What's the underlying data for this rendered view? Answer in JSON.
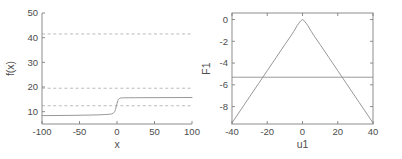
{
  "figure": {
    "panel_count": 2,
    "background_color": "#ffffff",
    "axis_color": "#808080",
    "curve_color": "#8c8c8c",
    "dashed_color": "#b3b3b3"
  },
  "chart_data": [
    {
      "type": "line",
      "panel": "left",
      "title": "",
      "xlabel": "x",
      "ylabel": "f(x)",
      "xlim": [
        -100,
        100
      ],
      "ylim": [
        5,
        50
      ],
      "xticks": [
        -100,
        -50,
        0,
        50,
        100
      ],
      "xtick_labels": [
        "-100",
        "-50",
        "0",
        "50",
        "100"
      ],
      "yticks": [
        10,
        20,
        30,
        40,
        50
      ],
      "ytick_labels": [
        "10",
        "20",
        "30",
        "40",
        "50"
      ],
      "grid": false,
      "box": false,
      "legend": null,
      "series": [
        {
          "name": "f(x) sigmoid step",
          "x": [
            -100,
            -80,
            -60,
            -40,
            -25,
            -15,
            -10,
            -7,
            -5,
            -3,
            -2,
            -1,
            0,
            1,
            2,
            3,
            5,
            7,
            10,
            15,
            25,
            40,
            60,
            80,
            100
          ],
          "y": [
            8.4,
            8.45,
            8.5,
            8.6,
            8.7,
            8.85,
            8.95,
            9.1,
            9.35,
            10.1,
            10.9,
            12.2,
            13.3,
            14.4,
            15.0,
            15.3,
            15.55,
            15.6,
            15.62,
            15.64,
            15.66,
            15.68,
            15.7,
            15.72,
            15.75
          ]
        }
      ],
      "reference_lines": [
        {
          "name": "upper-dashed",
          "orientation": "horizontal",
          "y": 41.5,
          "style": "dashed"
        },
        {
          "name": "middle-dashed",
          "orientation": "horizontal",
          "y": 19.5,
          "style": "dashed"
        },
        {
          "name": "lower-dashed",
          "orientation": "horizontal",
          "y": 12.4,
          "style": "dashed"
        }
      ]
    },
    {
      "type": "line",
      "panel": "right",
      "title": "",
      "xlabel": "u1",
      "ylabel": "F1",
      "xlim": [
        -40,
        40
      ],
      "ylim": [
        -9.6,
        0.6
      ],
      "xticks": [
        -40,
        -20,
        0,
        20,
        40
      ],
      "xtick_labels": [
        "-40",
        "-20",
        "0",
        "20",
        "40"
      ],
      "yticks": [
        0,
        -2,
        -4,
        -6,
        -8
      ],
      "ytick_labels": [
        "0",
        "-2",
        "-4",
        "-6",
        "-8"
      ],
      "grid": false,
      "box": true,
      "legend": null,
      "series": [
        {
          "name": "F1(u1)",
          "x": [
            -40,
            -35,
            -30,
            -25,
            -20,
            -15,
            -10,
            -7,
            -5,
            -3,
            -2,
            -1,
            0,
            1,
            2,
            3,
            5,
            7,
            10,
            15,
            20,
            25,
            30,
            35,
            40
          ],
          "y": [
            -9.5,
            -8.3,
            -7.1,
            -5.9,
            -4.7,
            -3.5,
            -2.3,
            -1.6,
            -1.1,
            -0.55,
            -0.33,
            -0.12,
            0.0,
            -0.12,
            -0.33,
            -0.55,
            -1.1,
            -1.6,
            -2.3,
            -3.5,
            -4.7,
            -5.9,
            -7.1,
            -8.3,
            -9.5
          ]
        }
      ],
      "reference_lines": [
        {
          "name": "threshold-line",
          "orientation": "horizontal",
          "y": -5.3,
          "style": "solid"
        }
      ]
    }
  ]
}
